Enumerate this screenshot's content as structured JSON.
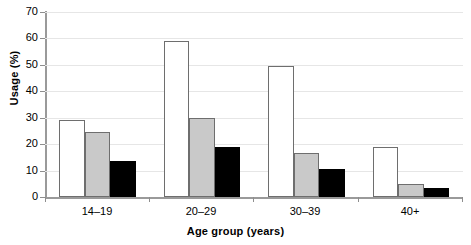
{
  "chart_data": {
    "type": "bar",
    "title": "",
    "xlabel": "Age group (years)",
    "ylabel": "Usage (%)",
    "categories": [
      "14–19",
      "20–29",
      "30–39",
      "40+"
    ],
    "ylim": [
      0,
      70
    ],
    "yticks": [
      0,
      10,
      20,
      30,
      40,
      50,
      60,
      70
    ],
    "ytick_labels": [
      "0",
      "10",
      "20",
      "30",
      "40",
      "50",
      "60",
      "70"
    ],
    "grid": true,
    "legend": "none",
    "series": [
      {
        "name": "series-1-white",
        "color": "#ffffff",
        "values": [
          29.0,
          59.0,
          49.5,
          19.0
        ]
      },
      {
        "name": "series-2-gray",
        "color": "#c9c9c9",
        "values": [
          24.5,
          30.0,
          16.5,
          5.0
        ]
      },
      {
        "name": "series-3-black",
        "color": "#000000",
        "values": [
          13.5,
          19.0,
          10.5,
          3.5
        ]
      }
    ]
  }
}
